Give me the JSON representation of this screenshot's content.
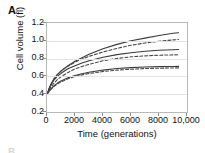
{
  "panel": {
    "letter": "A",
    "next_letter": "B"
  },
  "chart_data": {
    "type": "line",
    "title": "",
    "xlabel": "Time (generations)",
    "ylabel": "Cell volume (fl)",
    "xlim": [
      0,
      10000
    ],
    "ylim": [
      0.2,
      1.2
    ],
    "xticks": [
      0,
      2000,
      4000,
      6000,
      8000,
      10000
    ],
    "xticklabels": [
      "0",
      "2000",
      "4000",
      "6000",
      "8000",
      "10,000"
    ],
    "yticks": [
      0.2,
      0.4,
      0.6,
      0.8,
      1.0,
      1.2
    ],
    "yticklabels": [
      "0.2",
      "0.4",
      "0.6",
      "0.8",
      "1.0",
      "1.2"
    ],
    "grid": true,
    "grid_axis": "y",
    "legend": "none",
    "x": [
      0,
      250,
      500,
      750,
      1000,
      1500,
      2000,
      2500,
      3000,
      4000,
      5000,
      6000,
      7000,
      8000,
      9000,
      9400
    ],
    "series": [
      {
        "name": "population-1-observed",
        "style": "solid",
        "color": "#3a3a3a",
        "values": [
          0.4,
          0.5,
          0.57,
          0.62,
          0.66,
          0.72,
          0.77,
          0.81,
          0.85,
          0.91,
          0.96,
          1.0,
          1.03,
          1.06,
          1.085,
          1.09
        ]
      },
      {
        "name": "population-1-fitted",
        "style": "dashed",
        "color": "#4a4a4a",
        "values": [
          0.4,
          0.505,
          0.575,
          0.625,
          0.66,
          0.715,
          0.76,
          0.795,
          0.825,
          0.875,
          0.915,
          0.95,
          0.975,
          0.995,
          1.01,
          1.015
        ]
      },
      {
        "name": "population-2-observed",
        "style": "solid",
        "color": "#3a3a3a",
        "values": [
          0.4,
          0.495,
          0.56,
          0.6,
          0.635,
          0.685,
          0.72,
          0.75,
          0.775,
          0.815,
          0.845,
          0.865,
          0.882,
          0.893,
          0.9,
          0.902
        ]
      },
      {
        "name": "population-2-fitted",
        "style": "dashed",
        "color": "#4a4a4a",
        "values": [
          0.4,
          0.475,
          0.525,
          0.565,
          0.595,
          0.645,
          0.683,
          0.712,
          0.736,
          0.775,
          0.802,
          0.82,
          0.831,
          0.838,
          0.842,
          0.843
        ]
      },
      {
        "name": "population-3-observed",
        "style": "solid",
        "color": "#3a3a3a",
        "values": [
          0.4,
          0.455,
          0.495,
          0.525,
          0.548,
          0.584,
          0.61,
          0.63,
          0.646,
          0.671,
          0.688,
          0.699,
          0.706,
          0.71,
          0.712,
          0.713
        ]
      },
      {
        "name": "population-3-fitted",
        "style": "dashed",
        "color": "#4a4a4a",
        "values": [
          0.4,
          0.45,
          0.488,
          0.516,
          0.539,
          0.573,
          0.598,
          0.617,
          0.632,
          0.655,
          0.67,
          0.681,
          0.688,
          0.692,
          0.695,
          0.696
        ]
      }
    ]
  },
  "colors": {
    "axis": "#b9b9b9",
    "grid": "#e2e2e2",
    "text": "#111111",
    "background": "#ffffff"
  }
}
